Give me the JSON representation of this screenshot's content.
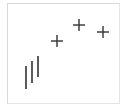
{
  "figure": {
    "frame": {
      "stroke": "#d8d8d8"
    },
    "stroke_color": "#333333",
    "vertical_bars": [
      {
        "x": 26,
        "y1": 66,
        "y2": 89
      },
      {
        "x": 32,
        "y1": 61,
        "y2": 83
      },
      {
        "x": 38,
        "y1": 56,
        "y2": 77
      }
    ],
    "plus_markers": [
      {
        "cx": 57,
        "cy": 41,
        "size": 12
      },
      {
        "cx": 79,
        "cy": 25,
        "size": 12
      },
      {
        "cx": 103,
        "cy": 32,
        "size": 12
      }
    ]
  }
}
